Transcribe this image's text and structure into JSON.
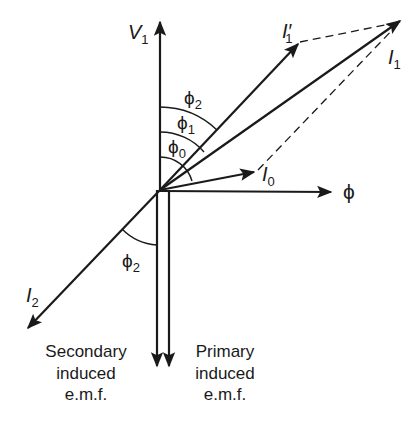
{
  "colors": {
    "ink": "#1a1a1a",
    "background": "#ffffff"
  },
  "phasors": {
    "V1": {
      "label": "V",
      "sub": "1"
    },
    "I1_prime": {
      "label": "I′",
      "sub": "1"
    },
    "I1": {
      "label": "I",
      "sub": "1"
    },
    "I0": {
      "label": "I",
      "sub": "0"
    },
    "phi": {
      "label": "ϕ"
    },
    "I2": {
      "label": "I",
      "sub": "2"
    }
  },
  "angles": {
    "phi2_upper": {
      "label": "ϕ",
      "sub": "2"
    },
    "phi1": {
      "label": "ϕ",
      "sub": "1"
    },
    "phi0": {
      "label": "ϕ",
      "sub": "0"
    },
    "phi2_lower": {
      "label": "ϕ",
      "sub": "2"
    }
  },
  "captions": {
    "secondary": [
      "Secondary",
      "induced",
      "e.m.f."
    ],
    "primary": [
      "Primary",
      "induced",
      "e.m.f."
    ]
  }
}
